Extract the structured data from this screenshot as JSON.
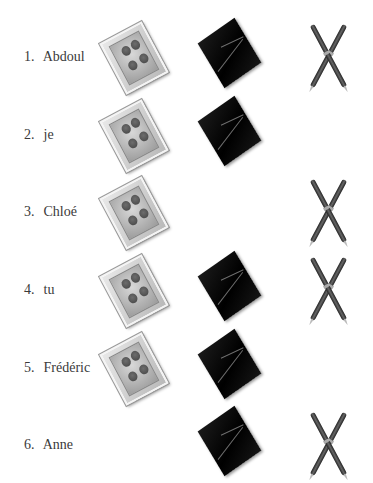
{
  "worksheet": {
    "items": [
      {
        "number": "1.",
        "name": "Abdoul",
        "photo": true,
        "marble_box": true,
        "pens": true
      },
      {
        "number": "2.",
        "name": "je",
        "photo": true,
        "marble_box": true,
        "pens": false
      },
      {
        "number": "3.",
        "name": "Chloé",
        "photo": true,
        "marble_box": false,
        "pens": true
      },
      {
        "number": "4.",
        "name": "tu",
        "photo": true,
        "marble_box": true,
        "pens": true
      },
      {
        "number": "5.",
        "name": "Frédéric",
        "photo": true,
        "marble_box": true,
        "pens": false
      },
      {
        "number": "6.",
        "name": "Anne",
        "photo": false,
        "marble_box": true,
        "pens": true
      }
    ],
    "icons": {
      "photo": "family-photo-icon",
      "marble_box": "black-marble-box-icon",
      "pens": "crossed-pens-icon"
    }
  }
}
